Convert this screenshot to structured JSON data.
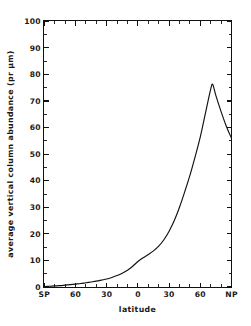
{
  "figure": {
    "background_color": "#ffffff",
    "ink_color": "#111111"
  },
  "chart_data": {
    "type": "line",
    "title": "",
    "subtitle": "",
    "xlabel": "latitude",
    "ylabel": "average vertical column abundance (pr μm)",
    "xlim": [
      -90,
      90
    ],
    "ylim": [
      0,
      100
    ],
    "grid": false,
    "legend": null,
    "legend_position": "none",
    "x_tick_labels": [
      "SP",
      "60",
      "30",
      "0",
      "30",
      "60",
      "NP"
    ],
    "x_tick_values": [
      -90,
      -60,
      -30,
      0,
      30,
      60,
      90
    ],
    "x_minor_tick_step": 10,
    "y_tick_labels": [
      "0",
      "10",
      "20",
      "30",
      "40",
      "50",
      "60",
      "70",
      "80",
      "90",
      "100"
    ],
    "y_tick_values": [
      0,
      10,
      20,
      30,
      40,
      50,
      60,
      70,
      80,
      90,
      100
    ],
    "tick_direction": "in",
    "frame": "full-box",
    "series": [
      {
        "name": "average vertical column abundance",
        "color": "#111111",
        "x": [
          -90,
          -85,
          -80,
          -75,
          -70,
          -65,
          -60,
          -55,
          -50,
          -45,
          -40,
          -35,
          -30,
          -25,
          -20,
          -15,
          -10,
          -5,
          0,
          5,
          10,
          15,
          20,
          25,
          30,
          35,
          40,
          45,
          50,
          55,
          60,
          65,
          70,
          72,
          75,
          80,
          85,
          90
        ],
        "y": [
          0.2,
          0.3,
          0.4,
          0.5,
          0.7,
          0.9,
          1.1,
          1.3,
          1.6,
          1.9,
          2.2,
          2.6,
          3.0,
          3.6,
          4.3,
          5.2,
          6.3,
          7.8,
          9.6,
          11.0,
          12.2,
          13.6,
          15.4,
          17.8,
          21.0,
          25.0,
          30.0,
          35.8,
          42.0,
          49.0,
          56.5,
          65.5,
          74.5,
          76.2,
          72.0,
          66.0,
          60.5,
          56.0
        ]
      }
    ],
    "annotations": []
  },
  "axis_titles": {
    "x": "latitude",
    "y": "average vertical column abundance (pr μm)"
  }
}
